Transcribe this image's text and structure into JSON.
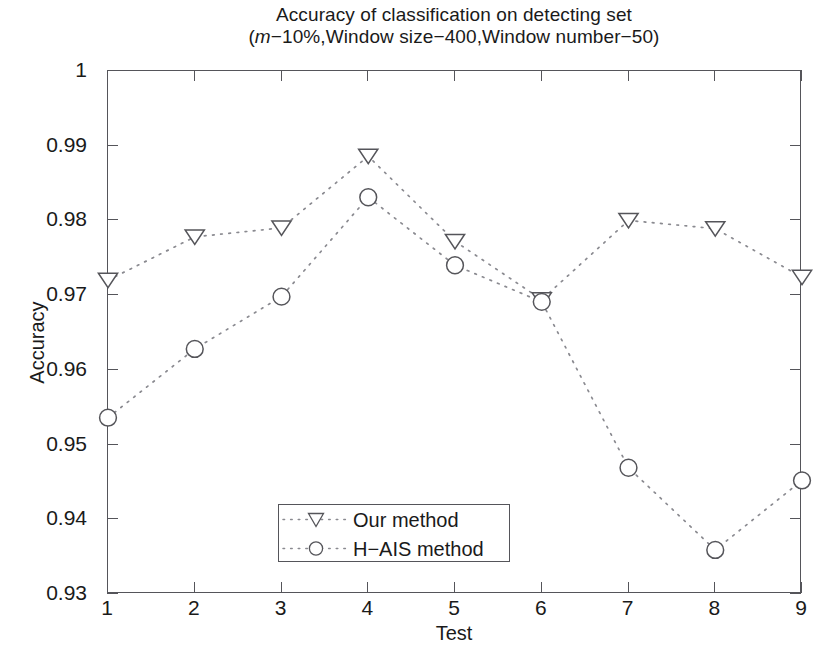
{
  "title": {
    "line1": "Accuracy of classification on detecting set",
    "line2_prefix": "(",
    "line2_italic": "m",
    "line2_rest": "−10%,Window size−400,Window number−50)"
  },
  "axes": {
    "xlabel": "Test",
    "ylabel": "Accuracy",
    "xticks": [
      "1",
      "2",
      "3",
      "4",
      "5",
      "6",
      "7",
      "8",
      "9"
    ],
    "yticks": [
      "0.93",
      "0.94",
      "0.95",
      "0.96",
      "0.97",
      "0.98",
      "0.99",
      "1"
    ]
  },
  "legend": {
    "items": [
      {
        "label": "Our method",
        "marker": "triangle-down-marker"
      },
      {
        "label": "H−AIS method",
        "marker": "circle-marker"
      }
    ]
  },
  "chart_data": {
    "type": "line",
    "title": "Accuracy of classification on detecting set (m−10%,Window size−400,Window number−50)",
    "xlabel": "Test",
    "ylabel": "Accuracy",
    "x": [
      1,
      2,
      3,
      4,
      5,
      6,
      7,
      8,
      9
    ],
    "xlim": [
      1,
      9
    ],
    "ylim": [
      0.93,
      1.0
    ],
    "ytick_values": [
      0.93,
      0.94,
      0.95,
      0.96,
      0.97,
      0.98,
      0.99,
      1.0
    ],
    "xtick_values": [
      1,
      2,
      3,
      4,
      5,
      6,
      7,
      8,
      9
    ],
    "grid": false,
    "legend_position": "inside-lower-left",
    "linestyle": "dotted",
    "series": [
      {
        "name": "Our method",
        "marker": "triangle-down",
        "values": [
          0.972,
          0.9778,
          0.979,
          0.9886,
          0.9772,
          0.9694,
          0.98,
          0.9789,
          0.9724
        ]
      },
      {
        "name": "H−AIS method",
        "marker": "circle",
        "values": [
          0.9536,
          0.9628,
          0.9698,
          0.9831,
          0.974,
          0.9691,
          0.9469,
          0.9359,
          0.9452
        ]
      }
    ],
    "colors": {
      "line": "#8a8a90",
      "marker": "#55555a",
      "axis": "#55555a"
    }
  }
}
